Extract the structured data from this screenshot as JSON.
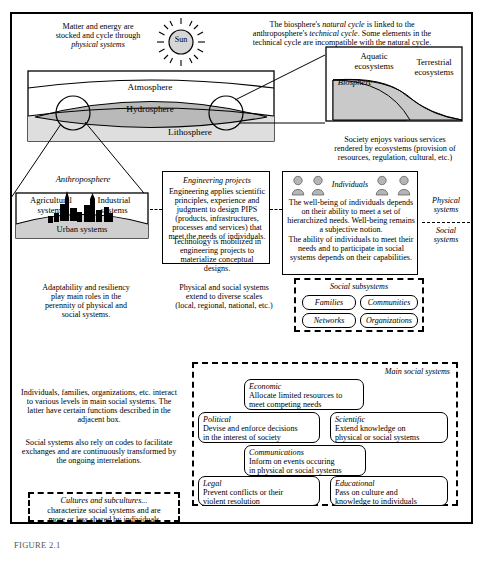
{
  "figure": {
    "caption": "FIGURE 2.1"
  },
  "top": {
    "left_note": "Matter and energy are stocked and cycle through physical systems",
    "left_note_italic_tail": "physical systems",
    "sun_label": "Sun",
    "right_note_line1": "The biosphere's natural cycle is linked to the",
    "right_note_line2": "anthroposphere's technical cycle. Some elements in the",
    "right_note_line3": "technical cycle are incompatible with the natural cycle."
  },
  "physical_block": {
    "atmosphere": "Atmosphere",
    "hydrosphere": "Hydrosphere",
    "lithosphere": "Lithosphere"
  },
  "biosphere_block": {
    "title": "Biosphere",
    "aquatic": "Aquatic ecosystems",
    "terrestrial": "Terrestrial ecosystems",
    "services_note": "Society enjoys various services rendered by ecosystems (provision of resources, regulation, cultural, etc.)"
  },
  "anthroposphere": {
    "title": "Anthroposphere",
    "agricultural": "Agricultural systems",
    "industrial": "Industrial systems",
    "urban": "Urban systems"
  },
  "engineering": {
    "title": "Engineering projects",
    "para1": "Engineering applies scientific principles, experience and judgment to design PIPS (products, infrastructures, processes and services) that meet the needs of individuals.",
    "para2": "Technology is mobilized in engineering projects to materialize conceptual designs."
  },
  "individuals": {
    "title": "Individuals",
    "para1": "The well-being of individuals depends on their ability to meet a set of hierarchized needs. Well-being remains a subjective notion.",
    "para2": "The ability of individuals to meet their needs and to participate in social systems depends on their capabilities."
  },
  "side_labels": {
    "physical_systems": "Physical systems",
    "social_systems": "Social systems"
  },
  "notes": {
    "adaptability": "Adaptability and resiliency play main roles in the perennity of physical and social systems.",
    "scales": "Physical and social systems extend to diverse scales (local, regional, national, etc.)",
    "interactions_p1": "Individuals, families, organizations, etc. interact to various levels in main social systems. The latter have certain functions described in the adjacent box.",
    "interactions_p2": "Social systems also rely on codes to facilitate exchanges and are continuously transformed by the ongoing interrelations."
  },
  "social_subsystems": {
    "title": "Social subsystems",
    "items": [
      "Families",
      "Communities",
      "Networks",
      "Organizations"
    ]
  },
  "main_social_systems": {
    "title": "Main social systems",
    "items": [
      {
        "name": "Economic",
        "desc_line1": "Allocate limited resources to",
        "desc_line2": "meet competing needs"
      },
      {
        "name": "Political",
        "desc_line1": "Devise and enforce decisions",
        "desc_line2": "in the interest of society"
      },
      {
        "name": "Scientific",
        "desc_line1": "Extend knowledge on",
        "desc_line2": "physical or social systems"
      },
      {
        "name": "Communications",
        "desc_line1": "Inform on events occuring",
        "desc_line2": "in physical or social systems"
      },
      {
        "name": "Legal",
        "desc_line1": "Prevent conflicts or their",
        "desc_line2": "violent resolution"
      },
      {
        "name": "Educational",
        "desc_line1": "Pass on culture and",
        "desc_line2": "knowledge to individuals"
      }
    ]
  },
  "cultures": {
    "title": "Cultures and subcultures...",
    "desc_line1": "characterize social systems and are",
    "desc_line2": "more or less shared by individuals"
  },
  "colors": {
    "ink": "#000000",
    "hydrosphere_fill": "#b9b9b9",
    "lithosphere_fill": "#dedede",
    "ecosystem_fill": "#c9c9c9",
    "urban_fill": "#cfcfcf",
    "sun_fill": "#d6d6d6",
    "person_fill": "#b5b5b5"
  }
}
